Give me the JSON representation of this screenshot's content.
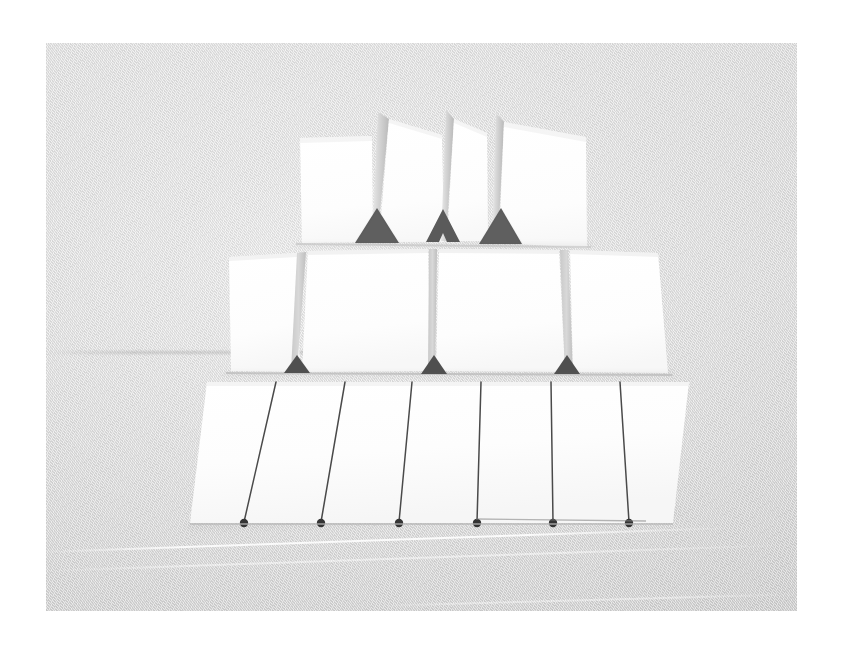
{
  "image": {
    "kind": "photograph",
    "subject": "house-of-cards",
    "description": "A three-tier house of cards built from plain white blank cards standing on a pale grey textured tabletop against a pale grey background.",
    "orientation": "landscape",
    "frame": {
      "mat_color": "#ffffff",
      "mat_left": 46,
      "mat_top": 43,
      "photo_width": 751,
      "photo_height": 568
    }
  },
  "scene": {
    "background_color": "#dcdcdc",
    "background_highlight": "#e6e6e6",
    "background_shadow": "#d0d0d0",
    "surface_texture": "fine-diagonal-fabric-weave",
    "horizon_label": "wall-table-junction",
    "lighting": "soft diffuse light from upper left"
  },
  "palette": {
    "card_face": "#fdfdfd",
    "card_side_light": "#ececec",
    "card_side_dark": "#bdbdbd",
    "apex_shadow": "#585858",
    "seam": "#4a4a4a",
    "seam_dot": "#3a3a3a",
    "cast_shadow": "rgba(120,120,120,0.30)"
  },
  "structure": {
    "tier_count": 3,
    "total_cards_visible": 14,
    "tiers": [
      {
        "index": 0,
        "name": "top-tier",
        "label": "Top tier",
        "card_faces": 3,
        "apex_shadows": 3,
        "note": "Three card faces separated by steeply foreshortened leaning card sides rising to sharp apexes."
      },
      {
        "index": 1,
        "name": "middle-tier",
        "label": "Middle tier",
        "card_faces": 4,
        "apex_shadows": 3,
        "note": "Four broad card faces with narrow grey leaning edges between them."
      },
      {
        "index": 2,
        "name": "bottom-tier",
        "label": "Bottom tier",
        "card_faces": 7,
        "seams": 6,
        "note": "Seven card faces butted together, divided by six thin dark seams each ending in a small dark contact dot at the table."
      }
    ]
  },
  "top_tier": {
    "faces": [
      {
        "name": "top-card-1",
        "x": 300,
        "y": 138,
        "w": 70,
        "h": 105,
        "skew": -2.0
      },
      {
        "name": "top-card-2",
        "x": 417,
        "y": 138,
        "w": 46,
        "h": 104,
        "skew": -1.0
      },
      {
        "name": "top-card-3",
        "x": 505,
        "y": 136,
        "w": 81,
        "h": 110,
        "skew": 1.5
      }
    ],
    "sides": [
      {
        "name": "top-side-1",
        "apex_x": 378,
        "apex_y": 112,
        "base_x": 370,
        "base_y": 241,
        "width": 16
      },
      {
        "name": "top-side-2",
        "apex_x": 448,
        "apex_y": 110,
        "base_x": 441,
        "base_y": 240,
        "width": 11
      },
      {
        "name": "top-side-3",
        "apex_x": 498,
        "apex_y": 113,
        "base_x": 494,
        "base_y": 242,
        "width": 13
      }
    ],
    "shadows": [
      {
        "name": "top-apex-shadow-1",
        "cx": 377,
        "cy": 241,
        "w": 44,
        "h": 33
      },
      {
        "name": "top-apex-shadow-2",
        "cx": 442,
        "cy": 240,
        "w": 33,
        "h": 33,
        "notched": true
      },
      {
        "name": "top-apex-shadow-3",
        "cx": 500,
        "cy": 240,
        "w": 42,
        "h": 33
      }
    ]
  },
  "middle_tier": {
    "faces": [
      {
        "name": "mid-card-1",
        "x": 229,
        "y": 256,
        "w": 68,
        "h": 116,
        "skew": -2.5
      },
      {
        "name": "mid-card-2",
        "x": 310,
        "y": 253,
        "w": 110,
        "h": 119,
        "skew": -1.0
      },
      {
        "name": "mid-card-3",
        "x": 443,
        "y": 252,
        "w": 105,
        "h": 120,
        "skew": 0.8
      },
      {
        "name": "mid-card-4",
        "x": 582,
        "y": 250,
        "w": 83,
        "h": 122,
        "skew": 2.0
      }
    ],
    "sides": [
      {
        "name": "mid-side-1",
        "top_x": 300,
        "bot_x": 293,
        "top_y": 252,
        "bot_y": 371,
        "width": 9
      },
      {
        "name": "mid-side-2",
        "top_x": 433,
        "bot_x": 430,
        "top_y": 250,
        "bot_y": 371,
        "width": 8
      },
      {
        "name": "mid-side-3",
        "top_x": 566,
        "bot_x": 562,
        "top_y": 249,
        "bot_y": 371,
        "width": 9
      }
    ],
    "shadows": [
      {
        "name": "mid-apex-shadow-1",
        "cx": 297,
        "cy": 370,
        "w": 26,
        "h": 17
      },
      {
        "name": "mid-apex-shadow-2",
        "cx": 434,
        "cy": 370,
        "w": 26,
        "h": 18
      },
      {
        "name": "mid-apex-shadow-3",
        "cx": 566,
        "cy": 370,
        "w": 26,
        "h": 17
      }
    ]
  },
  "bottom_tier": {
    "band": {
      "name": "bottom-card-band",
      "top_left_x": 207,
      "top_y": 382,
      "top_right_x": 689,
      "bottom_left_x": 190,
      "bottom_y": 523,
      "bottom_right_x": 673
    },
    "seams": [
      {
        "name": "bottom-seam-1",
        "top_x": 276,
        "bot_x": 244
      },
      {
        "name": "bottom-seam-2",
        "top_x": 345,
        "bot_x": 321
      },
      {
        "name": "bottom-seam-3",
        "top_x": 412,
        "bot_x": 399
      },
      {
        "name": "bottom-seam-4",
        "top_x": 481,
        "bot_x": 477
      },
      {
        "name": "bottom-seam-5",
        "top_x": 551,
        "bot_x": 553
      },
      {
        "name": "bottom-seam-6",
        "top_x": 620,
        "bot_x": 629
      }
    ],
    "contact_dots": 6
  }
}
